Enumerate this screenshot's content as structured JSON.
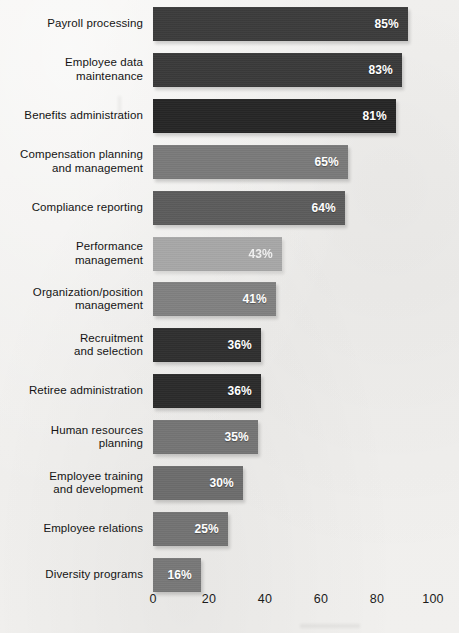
{
  "chart_data": {
    "type": "bar",
    "orientation": "horizontal",
    "title": "",
    "subtitle": "",
    "xlabel": "",
    "ylabel": "",
    "xlim": [
      0,
      100
    ],
    "grid": false,
    "legend": null,
    "value_suffix": "%",
    "xticks": [
      {
        "value": 0,
        "label": "0"
      },
      {
        "value": 20,
        "label": "20"
      },
      {
        "value": 40,
        "label": "40"
      },
      {
        "value": 60,
        "label": "60"
      },
      {
        "value": 80,
        "label": "80"
      },
      {
        "value": 100,
        "label": "100"
      }
    ],
    "categories": [
      "Payroll  processing",
      "Employee data\nmaintenance",
      "Benefits administration",
      "Compensation planning\nand management",
      "Compliance reporting",
      "Performance\nmanagement",
      "Organization/position\nmanagement",
      "Recruitment\nand selection",
      "Retiree administration",
      "Human resources\nplanning",
      "Employee training\nand development",
      "Employee relations",
      "Diversity programs"
    ],
    "values": [
      85,
      83,
      81,
      65,
      64,
      43,
      41,
      36,
      36,
      35,
      30,
      25,
      16
    ],
    "data_labels": [
      "85%",
      "83%",
      "81%",
      "65%",
      "64%",
      "43%",
      "41%",
      "36%",
      "36%",
      "35%",
      "30%",
      "25%",
      "16%"
    ],
    "bar_colors": [
      "#3c3c3c",
      "#3a3a3a",
      "#262626",
      "#7a7a7a",
      "#5c5c5c",
      "#a8a8a8",
      "#818181",
      "#2f2f2f",
      "#2b2b2b",
      "#757575",
      "#6d6d6d",
      "#737373",
      "#787878"
    ],
    "faded_bars": [
      5
    ],
    "background_color": "#f1f0ee",
    "label_color": "#141414",
    "value_text_color": "#ffffff"
  }
}
